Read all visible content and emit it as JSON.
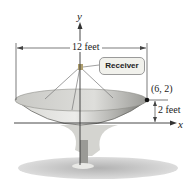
{
  "figure": {
    "axes": {
      "x_label": "x",
      "y_label": "y"
    },
    "dimensions": {
      "width_label": "12 feet",
      "height_label": "2 feet"
    },
    "callout": {
      "label": "Receiver"
    },
    "point": {
      "label": "(6, 2)",
      "x": 6,
      "y": 2
    },
    "colors": {
      "dish_light": "#e6e6e2",
      "dish_dark": "#8c8c88",
      "shadow": "#b9b9b9",
      "line": "#333333"
    }
  }
}
